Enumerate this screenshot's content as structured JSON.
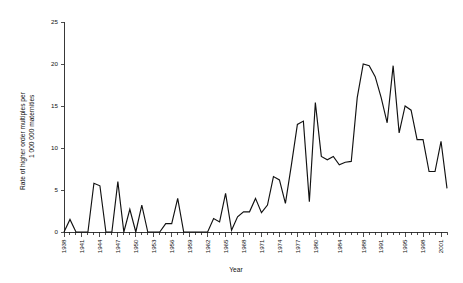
{
  "chart_data": {
    "type": "line",
    "title": "",
    "xlabel": "Year",
    "ylabel": "Rate of higher order multiples per 1 000 000 maternities",
    "ylabel_line1": "Rate of higher order multiples per",
    "ylabel_line2": "1 000 000 maternities",
    "ylim": [
      0,
      25
    ],
    "ytick_values": [
      0,
      5,
      10,
      15,
      20,
      25
    ],
    "ytick_labels": [
      "0",
      "5",
      "10",
      "15",
      "20",
      "25"
    ],
    "xlim": [
      1938,
      2002
    ],
    "xtick_labels": [
      "1938",
      "1941",
      "1944",
      "1947",
      "1950",
      "1953",
      "1956",
      "1959",
      "1962",
      "1965",
      "1968",
      "1971",
      "1974",
      "1977",
      "1980",
      "1984",
      "1988",
      "1991",
      "1995",
      "1998",
      "2001"
    ],
    "xtick_years": [
      1938,
      1941,
      1944,
      1947,
      1950,
      1953,
      1956,
      1959,
      1962,
      1965,
      1968,
      1971,
      1974,
      1977,
      1980,
      1984,
      1988,
      1991,
      1995,
      1998,
      2001
    ],
    "grid": false,
    "legend": false,
    "line_color": "#111111",
    "x": [
      1938,
      1939,
      1940,
      1941,
      1942,
      1943,
      1944,
      1945,
      1946,
      1947,
      1948,
      1949,
      1950,
      1951,
      1952,
      1953,
      1954,
      1955,
      1956,
      1957,
      1958,
      1959,
      1960,
      1961,
      1962,
      1963,
      1964,
      1965,
      1966,
      1967,
      1968,
      1969,
      1970,
      1971,
      1972,
      1973,
      1974,
      1975,
      1976,
      1977,
      1978,
      1979,
      1980,
      1981,
      1982,
      1983,
      1984,
      1985,
      1986,
      1987,
      1988,
      1989,
      1990,
      1991,
      1992,
      1993,
      1994,
      1995,
      1996,
      1997,
      1998,
      1999,
      2000,
      2001,
      2002
    ],
    "y": [
      0,
      1.5,
      0,
      0,
      0,
      5.8,
      5.5,
      0,
      0,
      6.0,
      0,
      2.7,
      0,
      3.2,
      0,
      0,
      0,
      1.0,
      1.0,
      4.0,
      0,
      0,
      0,
      0,
      0,
      1.6,
      1.2,
      4.6,
      0.2,
      1.8,
      2.4,
      2.4,
      4.0,
      2.3,
      3.2,
      6.6,
      6.2,
      3.4,
      8.0,
      12.8,
      13.2,
      3.6,
      15.4,
      9.0,
      8.6,
      9.0,
      8.0,
      8.3,
      8.4,
      16.0,
      20.0,
      19.8,
      18.5,
      16.0,
      13.0,
      19.8,
      11.8,
      15.0,
      14.5,
      11.0,
      11.0,
      7.2,
      7.2,
      10.8,
      5.2
    ],
    "series_name": "Rate of higher order multiples"
  }
}
